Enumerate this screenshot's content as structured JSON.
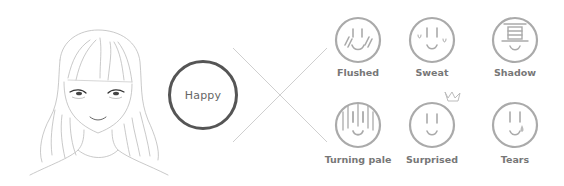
{
  "center_emotion": {
    "label": "Happy"
  },
  "effects": [
    {
      "label": "Flushed",
      "icon": "flushed-face-icon"
    },
    {
      "label": "Sweat",
      "icon": "sweat-face-icon"
    },
    {
      "label": "Shadow",
      "icon": "shadow-face-icon"
    },
    {
      "label": "Turning pale",
      "icon": "turning-pale-face-icon"
    },
    {
      "label": "Surprised",
      "icon": "surprised-face-icon"
    },
    {
      "label": "Tears",
      "icon": "tears-face-icon"
    }
  ],
  "colors": {
    "center_circle_border": "#555555",
    "icon_stroke": "#aaaaaa",
    "label_text": "#777777",
    "cross_lines": "#cccccc"
  }
}
